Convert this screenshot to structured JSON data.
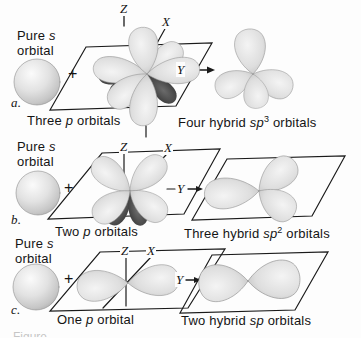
{
  "labels": {
    "plus": "+",
    "axis": {
      "z": "Z",
      "x": "X",
      "y": "Y"
    },
    "pure_s": {
      "pre": "Pure ",
      "em": "s",
      "line2": "orbital"
    }
  },
  "rows": [
    {
      "letter": "a.",
      "left_caption": {
        "pre": "Three ",
        "em": "p",
        "sup": "",
        "post": " orbitals"
      },
      "right_caption": {
        "pre": "Four hybrid ",
        "em": "sp",
        "sup": "3",
        "post": " orbitals"
      }
    },
    {
      "letter": "b.",
      "left_caption": {
        "pre": "Two ",
        "em": "p",
        "sup": "",
        "post": " orbitals"
      },
      "right_caption": {
        "pre": "Three hybrid ",
        "em": "sp",
        "sup": "2",
        "post": " orbitals"
      }
    },
    {
      "letter": "c.",
      "left_caption": {
        "pre": "One ",
        "em": "p",
        "sup": "",
        "post": " orbital"
      },
      "right_caption": {
        "pre": "Two hybrid ",
        "em": "sp",
        "sup": "",
        "post": " orbitals"
      }
    }
  ],
  "partial_caption": "Figure",
  "colors": {
    "background": "#fdfdfd",
    "lobe_light": "#d9d9d9",
    "lobe_dark": "#2f2f2f",
    "line": "#1a1a1a",
    "text": "#141414"
  }
}
